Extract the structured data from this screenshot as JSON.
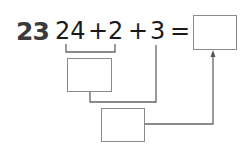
{
  "problem": {
    "number": "23",
    "terms": [
      "24",
      "+",
      "2",
      "+",
      "3",
      "="
    ]
  },
  "diagram": {
    "answer_box": "",
    "partial_sum_box": "",
    "second_step_box": "",
    "line_color": "#555555",
    "box_border_color": "#8a8a8a"
  }
}
